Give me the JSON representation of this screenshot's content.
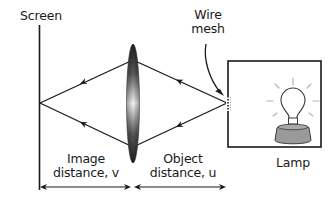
{
  "diagram": {
    "type": "optics-lens-experiment",
    "labels": {
      "screen": "Screen",
      "wire_mesh_line1": "Wire",
      "wire_mesh_line2": "mesh",
      "lamp": "Lamp",
      "image_distance_line1": "Image",
      "image_distance_line2": "distance, v",
      "object_distance_line1": "Object",
      "object_distance_line2": "distance, u"
    },
    "components": [
      {
        "name": "screen",
        "kind": "vertical-line"
      },
      {
        "name": "convex-lens",
        "kind": "biconvex-lens"
      },
      {
        "name": "wire-mesh",
        "kind": "object-point"
      },
      {
        "name": "lamp-box",
        "kind": "enclosure"
      },
      {
        "name": "lamp",
        "kind": "light-bulb"
      }
    ],
    "rays": [
      {
        "from": "wire-mesh",
        "to": "lens-top",
        "direction": "left"
      },
      {
        "from": "wire-mesh",
        "to": "lens-bottom",
        "direction": "left"
      },
      {
        "from": "lens-top",
        "to": "screen-image",
        "direction": "left"
      },
      {
        "from": "lens-bottom",
        "to": "screen-image",
        "direction": "left"
      }
    ],
    "dimensions": [
      {
        "name": "image-distance",
        "symbol": "v",
        "between": [
          "screen",
          "lens"
        ]
      },
      {
        "name": "object-distance",
        "symbol": "u",
        "between": [
          "lens",
          "wire-mesh"
        ]
      }
    ],
    "colors": {
      "line": "#1a1a1a",
      "lens_dark": "#2a2a2a",
      "lens_light": "#f2f2f2",
      "lamp_base": "#9a9a9a",
      "glow": "#b5b5b5"
    }
  }
}
